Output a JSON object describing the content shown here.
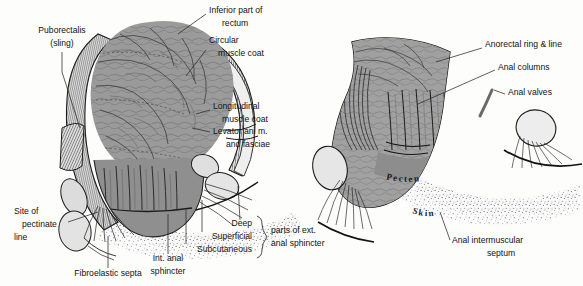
{
  "figure": {
    "background_color": "#fdfdfc",
    "ink_color": "#121212",
    "mucosa_color": "#9a9a9a",
    "muscle_color": "#c9c9c9",
    "skin_color": "#ececec"
  },
  "left_panel": {
    "labels": [
      {
        "id": "puborectalis",
        "lines": [
          "Puborectalis",
          "(sling)"
        ],
        "x": 62,
        "y": 38,
        "anchor": "middle"
      },
      {
        "id": "inferior-part-of-rectum",
        "lines": [
          "Inferior part of",
          "rectum"
        ],
        "x": 209,
        "y": 12,
        "anchor": "start"
      },
      {
        "id": "circular-muscle-coat",
        "lines": [
          "Circular",
          "muscle coat"
        ],
        "x": 209,
        "y": 42,
        "anchor": "start"
      },
      {
        "id": "longitudinal-muscle-coat",
        "lines": [
          "Longitudinal",
          "muscle coat"
        ],
        "x": 213,
        "y": 108,
        "anchor": "start"
      },
      {
        "id": "levator-ani-and-fasciae",
        "lines": [
          "Levator ani m.",
          "and fasciae"
        ],
        "x": 213,
        "y": 131,
        "anchor": "start"
      },
      {
        "id": "site-of-pectinate-line",
        "lines": [
          "Site of",
          "pectinate",
          "line"
        ],
        "x": 14,
        "y": 213,
        "anchor": "start"
      },
      {
        "id": "fibroelastic-septa",
        "lines": [
          "Fibroelastic septa"
        ],
        "x": 45,
        "y": 273,
        "anchor": "start"
      },
      {
        "id": "internal-anal-sphincter",
        "lines": [
          "Int. anal",
          "sphincter"
        ],
        "x": 168,
        "y": 262,
        "anchor": "middle"
      }
    ],
    "sphincter_group": {
      "items": [
        {
          "id": "deep",
          "label": "Deep",
          "x": 246,
          "y": 224
        },
        {
          "id": "superficial",
          "label": "Superficial",
          "x": 246,
          "y": 236
        },
        {
          "id": "subcutaneous",
          "label": "Subcutaneous",
          "x": 246,
          "y": 248
        }
      ],
      "bracket_label": [
        "parts of ext.",
        "anal sphincter"
      ],
      "bracket_x": 257,
      "bracket_label_x": 262,
      "bracket_label_y": 231
    }
  },
  "right_panel": {
    "labels": [
      {
        "id": "anorectal-ring-and-line",
        "lines": [
          "Anorectal ring & line"
        ],
        "x": 485,
        "y": 46,
        "anchor": "start"
      },
      {
        "id": "anal-columns",
        "lines": [
          "Anal columns"
        ],
        "x": 498,
        "y": 68,
        "anchor": "start"
      },
      {
        "id": "anal-valves",
        "lines": [
          "Anal valves"
        ],
        "x": 508,
        "y": 92,
        "anchor": "start"
      },
      {
        "id": "anal-intermuscular-septum",
        "lines": [
          "Anal intermuscular",
          "septum"
        ],
        "x": 452,
        "y": 240,
        "anchor": "start"
      }
    ],
    "inline_labels": [
      {
        "id": "pecten",
        "text": "Pecten"
      },
      {
        "id": "skin",
        "text": "Skin"
      }
    ]
  }
}
